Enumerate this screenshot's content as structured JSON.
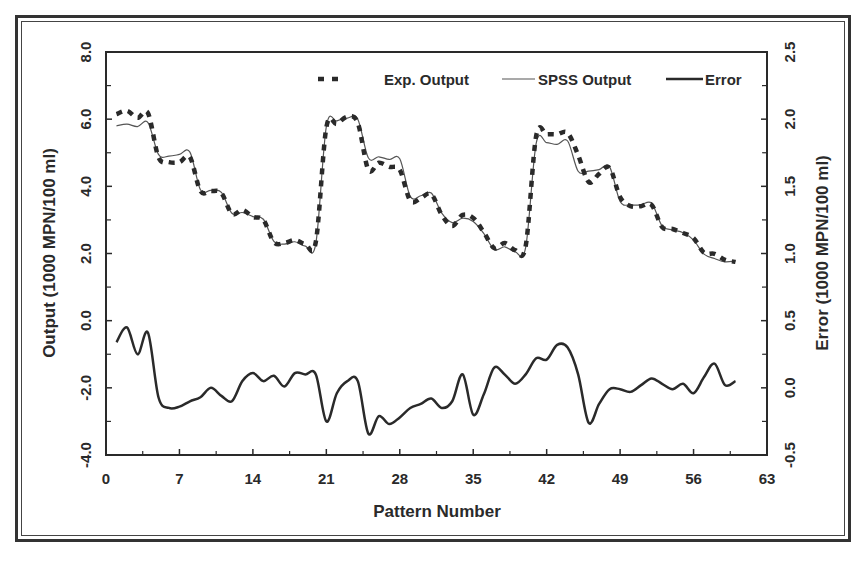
{
  "chart_data": {
    "type": "line",
    "title": "",
    "xlabel": "Pattern Number",
    "ylabel": "Output (1000 MPN/100 ml)",
    "y2label": "Error (1000 MPN/100 ml)",
    "xlim": [
      0,
      63
    ],
    "ylim": [
      -4.0,
      8.0
    ],
    "y2lim": [
      -0.5,
      2.5
    ],
    "x_ticks": [
      "0",
      "7",
      "14",
      "21",
      "28",
      "35",
      "42",
      "49",
      "56",
      "63"
    ],
    "y_ticks": [
      "8.0",
      "6.0",
      "4.0",
      "2.0",
      "0.0",
      "-2.0",
      "-4.0"
    ],
    "y2_ticks": [
      "2.5",
      "2.0",
      "1.5",
      "1.0",
      "0.5",
      "0.0",
      "-0.5"
    ],
    "grid": false,
    "legend_position": "top-right inside",
    "x": [
      1,
      2,
      3,
      4,
      5,
      6,
      7,
      8,
      9,
      10,
      11,
      12,
      13,
      14,
      15,
      16,
      17,
      18,
      19,
      20,
      21,
      22,
      23,
      24,
      25,
      26,
      27,
      28,
      29,
      30,
      31,
      32,
      33,
      34,
      35,
      36,
      37,
      38,
      39,
      40,
      41,
      42,
      43,
      44,
      45,
      46,
      47,
      48,
      49,
      50,
      51,
      52,
      53,
      54,
      55,
      56,
      57,
      58,
      59,
      60
    ],
    "series": [
      {
        "name": "Exp. Output",
        "axis": "left",
        "style": "dashed-thick",
        "values": [
          6.15,
          6.25,
          6.04,
          6.18,
          4.87,
          4.72,
          4.72,
          4.87,
          3.86,
          3.86,
          3.8,
          3.18,
          3.3,
          3.09,
          3.0,
          2.34,
          2.31,
          2.4,
          2.28,
          2.35,
          5.75,
          5.86,
          6.07,
          5.89,
          4.49,
          4.7,
          4.58,
          4.49,
          3.57,
          3.65,
          3.77,
          3.15,
          2.82,
          3.15,
          3.06,
          2.64,
          2.16,
          2.31,
          2.1,
          2.22,
          5.5,
          5.55,
          5.55,
          5.59,
          4.93,
          4.13,
          4.37,
          4.55,
          3.68,
          3.41,
          3.41,
          3.45,
          2.79,
          2.73,
          2.61,
          2.46,
          2.02,
          1.99,
          1.81,
          1.75
        ]
      },
      {
        "name": "SPSS Output",
        "axis": "left",
        "style": "thin-solid",
        "values": [
          5.8,
          5.85,
          5.78,
          5.9,
          4.95,
          4.9,
          4.95,
          5.02,
          3.9,
          3.88,
          3.82,
          3.2,
          3.22,
          3.1,
          3.02,
          2.36,
          2.28,
          2.35,
          2.22,
          2.3,
          5.78,
          5.95,
          6.03,
          6.0,
          4.85,
          4.88,
          4.8,
          4.82,
          3.7,
          3.72,
          3.8,
          3.2,
          2.92,
          3.05,
          2.95,
          2.6,
          2.12,
          2.2,
          2.05,
          2.18,
          5.28,
          5.3,
          5.25,
          5.35,
          4.45,
          4.45,
          4.5,
          4.58,
          3.55,
          3.45,
          3.45,
          3.5,
          2.82,
          2.7,
          2.62,
          2.4,
          1.98,
          1.85,
          1.75,
          1.78
        ]
      },
      {
        "name": "Error",
        "axis": "right",
        "style": "thick-solid",
        "values": [
          0.34,
          0.45,
          0.25,
          0.41,
          -0.07,
          -0.15,
          -0.14,
          -0.1,
          -0.07,
          0.0,
          -0.06,
          -0.1,
          0.05,
          0.11,
          0.05,
          0.09,
          0.01,
          0.11,
          0.1,
          0.1,
          -0.25,
          -0.04,
          0.05,
          0.05,
          -0.34,
          -0.21,
          -0.27,
          -0.22,
          -0.15,
          -0.12,
          -0.08,
          -0.15,
          -0.1,
          0.1,
          -0.2,
          -0.05,
          0.15,
          0.1,
          0.03,
          0.1,
          0.22,
          0.21,
          0.32,
          0.3,
          0.1,
          -0.26,
          -0.12,
          -0.01,
          -0.01,
          -0.03,
          0.02,
          0.07,
          0.03,
          -0.01,
          0.03,
          -0.04,
          0.08,
          0.18,
          0.02,
          0.05
        ]
      }
    ]
  },
  "legend": {
    "exp": "Exp. Output",
    "spss": "SPSS Output",
    "error": "Error"
  },
  "axes": {
    "x_title": "Pattern Number",
    "y_left_title": "Output (1000 MPN/100 ml)",
    "y_right_title": "Error (1000 MPN/100 ml)"
  },
  "colors": {
    "ink": "#2a2a2a",
    "frame": "#333333",
    "background": "#ffffff"
  }
}
